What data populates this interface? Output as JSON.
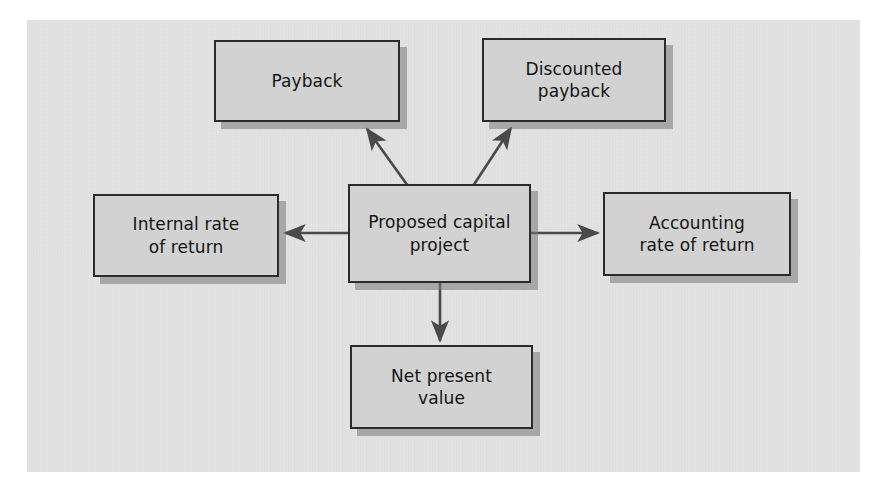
{
  "diagram": {
    "type": "flow-diagram",
    "background_color": "#e3e3e3",
    "page_color": "#ffffff",
    "node_fill_color": "#d2d2d2",
    "node_border_color": "#2b2b2b",
    "arrow_color": "#4a4a4a",
    "nodes": [
      {
        "id": "payback",
        "label": "Payback",
        "role": "appraisal-method"
      },
      {
        "id": "discounted-payback",
        "label": "Discounted\npayback",
        "role": "appraisal-method"
      },
      {
        "id": "internal-rate",
        "label": "Internal rate\nof return",
        "role": "appraisal-method"
      },
      {
        "id": "proposed-capital",
        "label": "Proposed capital\nproject",
        "role": "center"
      },
      {
        "id": "accounting-rate",
        "label": "Accounting\nrate of return",
        "role": "appraisal-method"
      },
      {
        "id": "net-present-value",
        "label": "Net present\nvalue",
        "role": "appraisal-method"
      }
    ],
    "edges": [
      {
        "from": "proposed-capital",
        "to": "payback",
        "direction": "up-left"
      },
      {
        "from": "proposed-capital",
        "to": "discounted-payback",
        "direction": "up-right"
      },
      {
        "from": "proposed-capital",
        "to": "internal-rate",
        "direction": "left"
      },
      {
        "from": "proposed-capital",
        "to": "accounting-rate",
        "direction": "right"
      },
      {
        "from": "proposed-capital",
        "to": "net-present-value",
        "direction": "down"
      }
    ]
  }
}
